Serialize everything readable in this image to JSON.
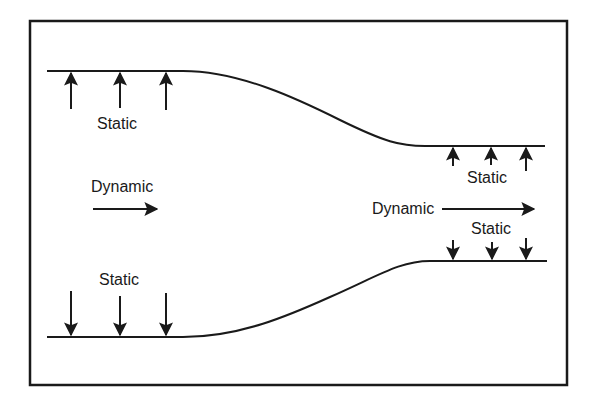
{
  "figure": {
    "type": "nozzle-pressure-diagram",
    "stroke_color": "#1a1a1a",
    "background_color": "#ffffff"
  },
  "labels": {
    "upper_left_static": "Static",
    "left_dynamic": "Dynamic",
    "lower_left_static": "Static",
    "upper_right_static": "Static",
    "right_dynamic": "Dynamic",
    "lower_right_static": "Static"
  },
  "arrows": {
    "upper_left_static": {
      "direction": "up",
      "count": 3
    },
    "lower_left_static": {
      "direction": "down",
      "count": 3
    },
    "upper_right_static": {
      "direction": "up",
      "count": 3
    },
    "lower_right_static": {
      "direction": "down",
      "count": 3
    },
    "left_dynamic": {
      "direction": "right",
      "count": 1
    },
    "right_dynamic": {
      "direction": "right",
      "count": 1
    }
  }
}
